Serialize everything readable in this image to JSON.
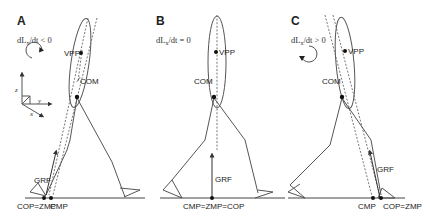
{
  "figure": {
    "panels": [
      {
        "id": "A",
        "label": "A",
        "equation": "dL",
        "equation_sub": "x",
        "equation_rest": "/dt < 0",
        "rotation": "clockwise",
        "labels": {
          "vpp": "VPP",
          "com": "COM",
          "grf": "GRF",
          "ground_left": "COP=ZMP",
          "ground_right": "CMP",
          "r": "r"
        }
      },
      {
        "id": "B",
        "label": "B",
        "equation": "dL",
        "equation_sub": "x",
        "equation_rest": "/dt = 0",
        "rotation": "none",
        "labels": {
          "vpp": "VPP",
          "com": "COM",
          "grf": "GRF",
          "ground": "CMP=ZMP=COP",
          "r": "r"
        }
      },
      {
        "id": "C",
        "label": "C",
        "equation": "dL",
        "equation_sub": "x",
        "equation_rest": "/dt > 0",
        "rotation": "counter-clockwise",
        "labels": {
          "vpp": "VPP",
          "com": "COM",
          "grf": "GRF",
          "ground_left": "CMP",
          "ground_right": "COP=ZMP",
          "r": "r"
        }
      }
    ],
    "axes": {
      "z": "z",
      "y": "y",
      "x": "x"
    }
  }
}
